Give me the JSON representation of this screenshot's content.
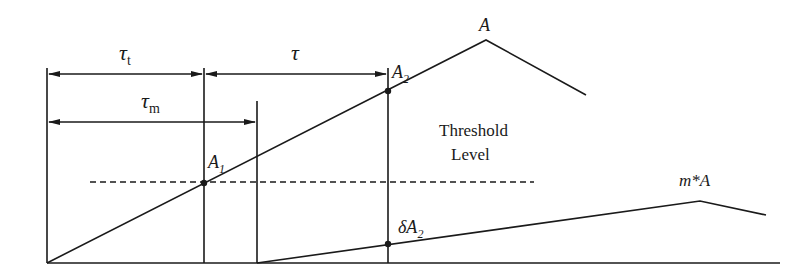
{
  "diagram": {
    "colors": {
      "stroke": "#1a1a1a",
      "background": "#ffffff"
    },
    "labels": {
      "tau_t": {
        "main": "τ",
        "sub": "t"
      },
      "tau": {
        "main": "τ"
      },
      "tau_m": {
        "main": "τ",
        "sub": "m"
      },
      "A": "A",
      "A2": {
        "main": "A",
        "sub": "2"
      },
      "A1": {
        "main": "A",
        "sub": "1"
      },
      "threshold_line1": "Threshold",
      "threshold_line2": "Level",
      "delta_A2": {
        "main": "δA",
        "sub": "2"
      },
      "mA": "m*A"
    },
    "elements": {
      "main_pulse": {
        "points": [
          [
            47,
            263
          ],
          [
            486,
            40
          ],
          [
            586,
            95
          ]
        ]
      },
      "attenuated_pulse": {
        "points": [
          [
            257,
            263
          ],
          [
            700,
            201
          ],
          [
            766,
            215
          ]
        ]
      },
      "threshold_level_y": 182,
      "markers": [
        {
          "name": "A1",
          "x": 204,
          "y": 183
        },
        {
          "name": "A2",
          "x": 388,
          "y": 91
        },
        {
          "name": "deltaA2",
          "x": 388,
          "y": 244
        }
      ]
    }
  }
}
